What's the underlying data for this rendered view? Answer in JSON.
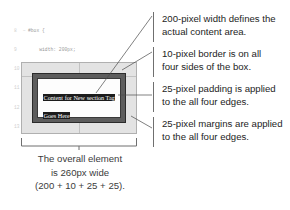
{
  "code": {
    "language": "css",
    "lines": [
      {
        "number": "8",
        "fold": "−",
        "text": "#box {"
      },
      {
        "number": "9",
        "fold": "",
        "text": "    width: 200px;"
      },
      {
        "number": "10",
        "fold": "",
        "text": "    margin: 25px;"
      },
      {
        "number": "11",
        "fold": "",
        "text": "    padding: 25px;"
      },
      {
        "number": "12",
        "fold": "",
        "text": "    border: 10px solid #000;"
      },
      {
        "number": "13",
        "fold": "",
        "text": "}"
      }
    ]
  },
  "diagram": {
    "content_text": "Content for New section Tag Goes Here",
    "margin_color": "#e3e3e3",
    "border_color": "#5d5d5d",
    "padding_color": "#fdfdfd",
    "content_highlight_color": "#1c1c1c"
  },
  "annotations": [
    {
      "id": "width",
      "lines": [
        "200-pixel width defines the",
        "actual content area."
      ]
    },
    {
      "id": "border",
      "lines": [
        "10-pixel border is on all",
        "four sides of the box."
      ]
    },
    {
      "id": "padding",
      "lines": [
        "25-pixel padding is applied",
        "to the all four edges."
      ]
    },
    {
      "id": "margin",
      "lines": [
        "25-pixel margins are applied",
        "to the all four edges."
      ]
    }
  ],
  "caption": {
    "lines": [
      "The overall element",
      "is 260px wide",
      "(200 + 10 + 25 + 25)."
    ]
  }
}
